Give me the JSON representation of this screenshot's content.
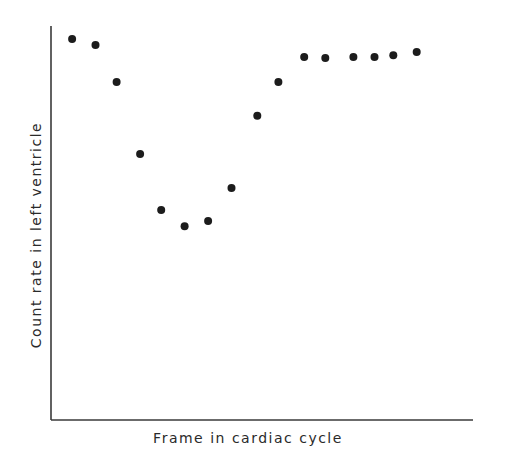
{
  "chart_data": {
    "type": "scatter",
    "title": "",
    "xlabel": "Frame in cardiac cycle",
    "ylabel": "Count rate in left ventricle",
    "xlim": [
      0,
      18
    ],
    "ylim": [
      0,
      100
    ],
    "grid": false,
    "ticks": "none",
    "legend": "none",
    "series": [
      {
        "name": "count rate",
        "color": "#1c1c1c",
        "x": [
          0.9,
          1.9,
          2.8,
          3.8,
          4.7,
          5.7,
          6.7,
          7.7,
          8.8,
          9.7,
          10.8,
          11.7,
          12.9,
          13.8,
          14.6,
          15.6
        ],
        "y": [
          96.7,
          95.2,
          85.8,
          67.5,
          53.3,
          49.2,
          50.5,
          58.9,
          77.2,
          85.8,
          92.1,
          91.9,
          92.1,
          92.1,
          92.6,
          93.4
        ]
      }
    ]
  }
}
